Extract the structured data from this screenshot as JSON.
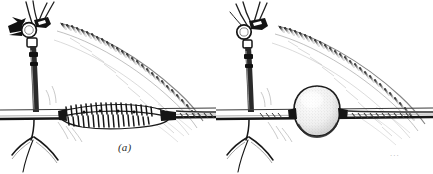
{
  "figure": {
    "background_color": "#ffffff",
    "ink_color": "#1a1a1a",
    "mid_ink_color": "#4a4a4a",
    "light_ink_color": "#8d8d8d",
    "faint_ink_color": "#b9b9b9",
    "style": "pen-and-ink anatomical line drawing",
    "artifact_marks": "..."
  },
  "panels": [
    {
      "id": "a",
      "caption": "(a)",
      "subject": "vessel with sutured reinforced segment",
      "elements": {
        "arrowhead": "solid-black-wedge-arrowhead",
        "clip_ring": "circular clip at vessel junction",
        "vertical_vessel": "descending vertical vessel trunk",
        "horizontal_vessel": "horizontal vessel running across panel",
        "branch_fork": "bifurcating branches below horizontal vessel",
        "striated_band": "diagonal striated band descending to the right",
        "feature": "suture-line / stented vessel segment with transverse stitch marks"
      }
    },
    {
      "id": "b",
      "caption": "(b)",
      "subject": "vessel with rounded aneurysmal bulge",
      "elements": {
        "arrowhead": "none",
        "clip_ring": "circular clip at vessel junction",
        "vertical_vessel": "descending vertical vessel trunk",
        "horizontal_vessel": "horizontal vessel running across panel",
        "branch_fork": "bifurcating branches below horizontal vessel",
        "striated_band": "diagonal striated band descending to the right",
        "feature": "round stippled saccular bulge on horizontal vessel"
      }
    }
  ]
}
